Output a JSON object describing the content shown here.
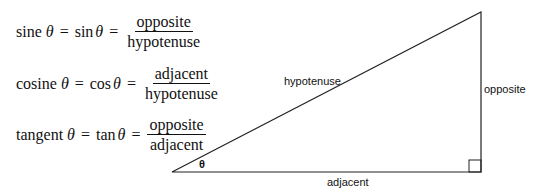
{
  "formulas": [
    {
      "name": "sine",
      "func": "sin",
      "numerator": "opposite",
      "denominator": "hypotenuse"
    },
    {
      "name": "cosine",
      "func": "cos",
      "numerator": "adjacent",
      "denominator": "hypotenuse"
    },
    {
      "name": "tangent",
      "func": "tan",
      "numerator": "opposite",
      "denominator": "adjacent"
    }
  ],
  "symbols": {
    "theta": "θ",
    "equals": "="
  },
  "triangle": {
    "labels": {
      "hypotenuse": "hypotenuse",
      "opposite": "opposite",
      "adjacent": "adjacent",
      "angle": "θ"
    },
    "vertices": {
      "angle_vertex": [
        172,
        172
      ],
      "right_angle_vertex": [
        481,
        172
      ],
      "top_vertex": [
        481,
        12
      ]
    },
    "line_color": "#222222"
  }
}
